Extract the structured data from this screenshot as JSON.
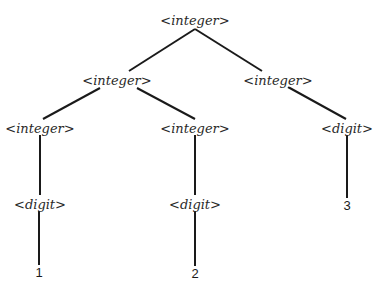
{
  "diagram": {
    "type": "parse-tree",
    "line_color": "#1a1a1a",
    "nodes": [
      {
        "id": "n0",
        "label": "<integer>",
        "kind": "nonterminal",
        "x": 195,
        "y": 20
      },
      {
        "id": "n1",
        "label": "<integer>",
        "kind": "nonterminal",
        "x": 117,
        "y": 80
      },
      {
        "id": "n2",
        "label": "<integer>",
        "kind": "nonterminal",
        "x": 278,
        "y": 80
      },
      {
        "id": "n3",
        "label": "<integer>",
        "kind": "nonterminal",
        "x": 40,
        "y": 128
      },
      {
        "id": "n4",
        "label": "<integer>",
        "kind": "nonterminal",
        "x": 195,
        "y": 128
      },
      {
        "id": "n5",
        "label": "<digit>",
        "kind": "nonterminal",
        "x": 347,
        "y": 128
      },
      {
        "id": "n6",
        "label": "<digit>",
        "kind": "nonterminal",
        "x": 40,
        "y": 204
      },
      {
        "id": "n7",
        "label": "<digit>",
        "kind": "nonterminal",
        "x": 195,
        "y": 204
      },
      {
        "id": "n8",
        "label": "3",
        "kind": "terminal",
        "x": 347,
        "y": 205
      },
      {
        "id": "n9",
        "label": "1",
        "kind": "terminal",
        "x": 39,
        "y": 272
      },
      {
        "id": "n10",
        "label": "2",
        "kind": "terminal",
        "x": 195,
        "y": 273
      }
    ],
    "edges": [
      {
        "from": "n0",
        "to": "n1",
        "x1": 195,
        "y1": 29,
        "x2": 129,
        "y2": 71
      },
      {
        "from": "n0",
        "to": "n2",
        "x1": 195,
        "y1": 29,
        "x2": 262,
        "y2": 71
      },
      {
        "from": "n1",
        "to": "n3",
        "x1": 100,
        "y1": 88,
        "x2": 43,
        "y2": 119
      },
      {
        "from": "n1",
        "to": "n4",
        "x1": 137,
        "y1": 88,
        "x2": 195,
        "y2": 119
      },
      {
        "from": "n2",
        "to": "n5",
        "x1": 288,
        "y1": 87,
        "x2": 346,
        "y2": 119
      },
      {
        "from": "n3",
        "to": "n6",
        "x1": 40,
        "y1": 135,
        "x2": 40,
        "y2": 195
      },
      {
        "from": "n4",
        "to": "n7",
        "x1": 195,
        "y1": 135,
        "x2": 195,
        "y2": 195
      },
      {
        "from": "n5",
        "to": "n8",
        "x1": 347,
        "y1": 135,
        "x2": 347,
        "y2": 198
      },
      {
        "from": "n6",
        "to": "n9",
        "x1": 39,
        "y1": 211,
        "x2": 39,
        "y2": 265
      },
      {
        "from": "n7",
        "to": "n10",
        "x1": 195,
        "y1": 211,
        "x2": 195,
        "y2": 266
      }
    ]
  }
}
